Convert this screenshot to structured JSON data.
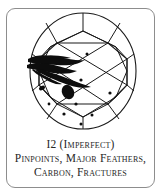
{
  "card": {
    "border_color": "#8d8d8d",
    "background_color": "#ffffff"
  },
  "caption": {
    "grade_line": "I2 (Imperfect)",
    "features_line_1": "Pinpoints, Major Feathers,",
    "features_line_2": "Carbon, Fractures",
    "text_color": "#262626"
  },
  "diagram": {
    "line_color": "#1a1a1a",
    "inclusion_color": "#0d0d0d",
    "girdle": {
      "cx": 76,
      "cy": 62,
      "rx": 53,
      "ry": 58
    },
    "table_octagon": [
      [
        50,
        34
      ],
      [
        101,
        34
      ],
      [
        120,
        50
      ],
      [
        120,
        76
      ],
      [
        101,
        95
      ],
      [
        50,
        95
      ],
      [
        32,
        76
      ],
      [
        32,
        50
      ]
    ],
    "inclusions": {
      "major_feathers": [
        {
          "name": "feather-upper-left-primary"
        },
        {
          "name": "feather-upper-left-secondary"
        },
        {
          "name": "feather-diagonal-streak"
        }
      ],
      "carbon_spots": [
        {
          "name": "carbon-center-oval",
          "cx": 61,
          "cy": 83,
          "rx": 6.0,
          "ry": 7.5,
          "rotate": -25
        },
        {
          "name": "carbon-left-comma",
          "cx": 35,
          "cy": 79,
          "rx": 3.2,
          "ry": 2.0,
          "rotate": -30
        }
      ],
      "pinpoints": [
        {
          "cx": 80,
          "cy": 45,
          "r": 1.5
        },
        {
          "cx": 74,
          "cy": 71,
          "r": 1.6
        },
        {
          "cx": 69,
          "cy": 95,
          "r": 1.6
        },
        {
          "cx": 103,
          "cy": 84,
          "r": 1.6
        },
        {
          "cx": 57,
          "cy": 105,
          "r": 1.6
        },
        {
          "cx": 85,
          "cy": 106,
          "r": 1.5
        },
        {
          "cx": 74,
          "cy": 115,
          "r": 1.5
        },
        {
          "cx": 42,
          "cy": 95,
          "r": 1.4
        }
      ]
    }
  }
}
